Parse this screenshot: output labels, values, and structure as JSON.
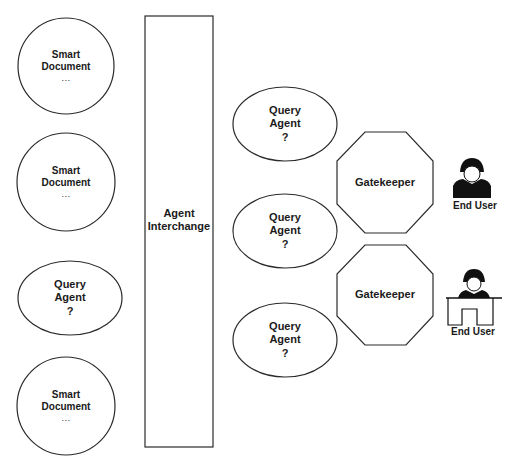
{
  "diagram": {
    "stroke_color": "#2a2a2a",
    "fill_color": "#ffffff",
    "text_color": "#1a1a1a",
    "left_column": [
      {
        "type": "smart-document",
        "shape": "circle",
        "line1": "Smart",
        "line2": "Document",
        "line3": "..."
      },
      {
        "type": "smart-document",
        "shape": "circle",
        "line1": "Smart",
        "line2": "Document",
        "line3": "..."
      },
      {
        "type": "query-agent",
        "shape": "ellipse",
        "line1": "Query",
        "line2": "Agent",
        "line3": "?"
      },
      {
        "type": "smart-document",
        "shape": "circle",
        "line1": "Smart",
        "line2": "Document",
        "line3": "..."
      }
    ],
    "interchange": {
      "shape": "rectangle",
      "line1": "Agent",
      "line2": "Interchange"
    },
    "right_column": [
      {
        "type": "query-agent",
        "shape": "ellipse",
        "line1": "Query",
        "line2": "Agent",
        "line3": "?"
      },
      {
        "type": "query-agent",
        "shape": "ellipse",
        "line1": "Query",
        "line2": "Agent",
        "line3": "?"
      },
      {
        "type": "query-agent",
        "shape": "ellipse",
        "line1": "Query",
        "line2": "Agent",
        "line3": "?"
      }
    ],
    "gatekeepers": [
      {
        "shape": "octagon",
        "label": "Gatekeeper"
      },
      {
        "shape": "octagon",
        "label": "Gatekeeper"
      }
    ],
    "end_users": [
      {
        "icon": "person-icon",
        "label": "End User"
      },
      {
        "icon": "person-at-desk-icon",
        "label": "End User"
      }
    ]
  }
}
